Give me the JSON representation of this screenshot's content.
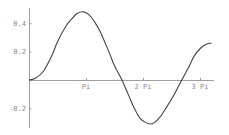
{
  "chart_data": {
    "type": "line",
    "title": "",
    "xlabel": "",
    "ylabel": "",
    "xlim": [
      0,
      3.3
    ],
    "x_units": "pi",
    "ylim": [
      -0.34,
      0.5
    ],
    "grid": false,
    "legend": null,
    "x_ticks": [
      {
        "value": 1,
        "label": "Pi"
      },
      {
        "value": 2,
        "label": "2 Pi"
      },
      {
        "value": 3,
        "label": "3 Pi"
      }
    ],
    "y_ticks": [
      {
        "value": 0.4,
        "label": "0.4"
      },
      {
        "value": 0.2,
        "label": "0.2"
      },
      {
        "value": -0.2,
        "label": "-0.2"
      }
    ],
    "series": [
      {
        "name": "f(x)",
        "color": "#444444",
        "x": [
          0,
          0.1,
          0.25,
          0.4,
          0.5,
          0.65,
          0.75,
          0.85,
          0.96,
          1.05,
          1.15,
          1.25,
          1.4,
          1.5,
          1.63,
          1.75,
          1.85,
          1.95,
          2.05,
          2.12,
          2.2,
          2.3,
          2.4,
          2.55,
          2.68,
          2.8,
          2.9,
          3.0,
          3.1,
          3.2
        ],
        "values": [
          0,
          0.01,
          0.06,
          0.17,
          0.27,
          0.38,
          0.43,
          0.47,
          0.48,
          0.46,
          0.41,
          0.34,
          0.2,
          0.1,
          0,
          -0.11,
          -0.2,
          -0.27,
          -0.3,
          -0.31,
          -0.3,
          -0.26,
          -0.2,
          -0.1,
          0,
          0.09,
          0.17,
          0.22,
          0.25,
          0.26
        ]
      }
    ]
  },
  "axes": {
    "color": "#a0a0a0",
    "origin_px": [
      29,
      80
    ],
    "px_per_pi": 57,
    "px_per_unit_y": 142
  }
}
